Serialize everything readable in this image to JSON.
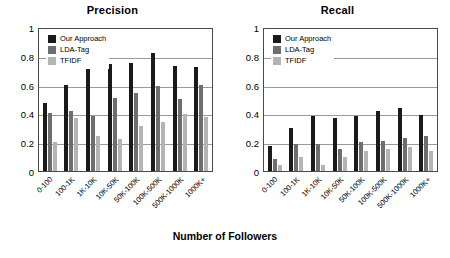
{
  "chart_data": [
    {
      "type": "bar",
      "title": "Precision",
      "xlabel": "Number of Followers",
      "ylabel": "",
      "ylim": [
        0,
        1
      ],
      "yticks": [
        "0",
        "0.2",
        "0.4",
        "0.6",
        "0.8",
        "1"
      ],
      "grid": true,
      "legend_position": "top-left",
      "categories": [
        "0-100",
        "100-1K",
        "1K-10K",
        "10K-50K",
        "50K-100K",
        "100K-500K",
        "500K-1000K",
        "1000K+"
      ],
      "series": [
        {
          "name": "Our Approach",
          "color": "#1a1a1a",
          "values": [
            0.47,
            0.6,
            0.76,
            0.745,
            0.75,
            0.82,
            0.73,
            0.72
          ]
        },
        {
          "name": "LDA-Tag",
          "color": "#6e6e6e",
          "values": [
            0.4,
            0.415,
            0.385,
            0.51,
            0.54,
            0.59,
            0.5,
            0.595
          ]
        },
        {
          "name": "TFIDF",
          "color": "#b4b4b4",
          "values": [
            0.2,
            0.365,
            0.24,
            0.22,
            0.31,
            0.34,
            0.395,
            0.375
          ]
        }
      ]
    },
    {
      "type": "bar",
      "title": "Recall",
      "xlabel": "Number of Followers",
      "ylabel": "",
      "ylim": [
        0,
        1
      ],
      "yticks": [
        "0",
        "0.2",
        "0.4",
        "0.6",
        "0.8",
        "1"
      ],
      "grid": true,
      "legend_position": "top-left",
      "categories": [
        "0-100",
        "100-1K",
        "1K-10K",
        "10K-50K",
        "50K-100K",
        "100K-500K",
        "500K-1000K",
        "1000K+"
      ],
      "series": [
        {
          "name": "Our Approach",
          "color": "#1a1a1a",
          "values": [
            0.175,
            0.3,
            0.385,
            0.37,
            0.38,
            0.415,
            0.44,
            0.39
          ]
        },
        {
          "name": "LDA-Tag",
          "color": "#6e6e6e",
          "values": [
            0.085,
            0.185,
            0.19,
            0.155,
            0.2,
            0.21,
            0.23,
            0.24
          ]
        },
        {
          "name": "TFIDF",
          "color": "#b4b4b4",
          "values": [
            0.04,
            0.1,
            0.045,
            0.1,
            0.14,
            0.155,
            0.165,
            0.14
          ]
        }
      ]
    }
  ],
  "figure": {
    "axis_title": "Number of Followers"
  }
}
